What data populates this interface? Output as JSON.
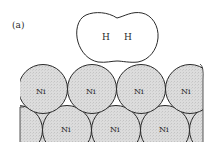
{
  "figure": {
    "panel_label": "(a)",
    "molecule": {
      "atoms": [
        "H",
        "H"
      ]
    },
    "surface": {
      "top_row": [
        "Ni",
        "Ni",
        "Ni",
        "Ni"
      ],
      "bottom_row": [
        "Ni",
        "Ni",
        "Ni"
      ]
    },
    "colors": {
      "atom_fill": "#d9d9d9",
      "outline": "#2a2a2a",
      "molecule_fill": "#ffffff"
    }
  }
}
